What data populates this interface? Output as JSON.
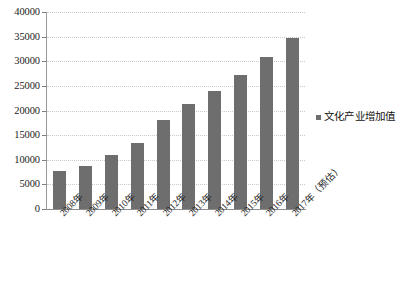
{
  "chart_data": {
    "type": "bar",
    "title": "",
    "subtitle": "",
    "xlabel": "",
    "ylabel": "",
    "ylim": [
      0,
      40000
    ],
    "ytick_values": [
      0,
      5000,
      10000,
      15000,
      20000,
      25000,
      30000,
      35000,
      40000
    ],
    "ytick_labels": [
      "0",
      "5000",
      "10000",
      "15000",
      "20000",
      "25000",
      "30000",
      "35000",
      "40000"
    ],
    "grid": true,
    "legend_position": "right",
    "categories": [
      "2008年",
      "2009年",
      "2010年",
      "2011年",
      "2012年",
      "2013年",
      "2014年",
      "2015年",
      "2016年",
      "2017年（预估）"
    ],
    "series": [
      {
        "name": "文化产业增加值",
        "color": "#6e6e6e",
        "values": [
          7630,
          8790,
          11052,
          13479,
          18071,
          21400,
          24017,
          27235,
          30785,
          34722
        ]
      }
    ]
  },
  "legend": {
    "marker_icon": "square-marker-icon",
    "label": "文化产业增加值"
  },
  "colors": {
    "bar": "#6e6e6e",
    "gridline": "#c9c9c9",
    "axis": "#8d8d8d",
    "text": "#1b1b1b",
    "background": "#ffffff"
  }
}
